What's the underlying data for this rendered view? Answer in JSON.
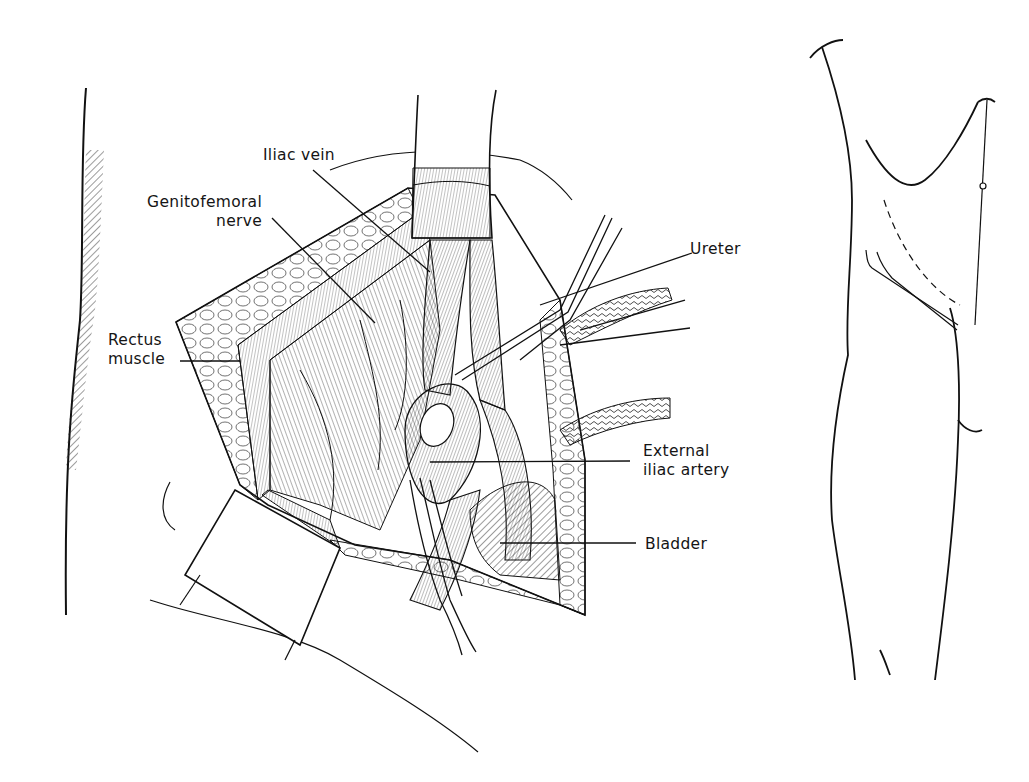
{
  "figure": {
    "type": "surgical anatomy illustration",
    "main_view": "operative field exposure (retroperitoneal pelvic approach)",
    "inset_view": "body outline with incision site"
  },
  "labels": {
    "iliac_vein": "Iliac vein",
    "genitofemoral_nerve": {
      "line1": "Genitofemoral",
      "line2": "nerve"
    },
    "rectus_muscle": {
      "line1": "Rectus",
      "line2": "muscle"
    },
    "ureter": "Ureter",
    "external_iliac_artery": {
      "line1": "External",
      "line2": "iliac artery"
    },
    "bladder": "Bladder"
  },
  "inset": {
    "incision_marker": "c"
  },
  "colors": {
    "ink": "#151515",
    "background": "#ffffff"
  }
}
